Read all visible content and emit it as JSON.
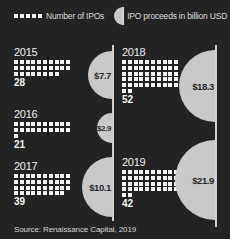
{
  "legend": {
    "ipo_count_label": "Number of IPOs",
    "proceeds_label": "IPO proceeds in billion USD"
  },
  "panels": [
    {
      "year": "2015",
      "count": "28",
      "proceeds": "$7.7"
    },
    {
      "year": "2016",
      "count": "21",
      "proceeds": "$2.9"
    },
    {
      "year": "2017",
      "count": "39",
      "proceeds": "$10.1"
    },
    {
      "year": "2018",
      "count": "52",
      "proceeds": "$18.3"
    },
    {
      "year": "2019",
      "count": "42",
      "proceeds": "$21.9"
    }
  ],
  "source": "Source: Renaissance Capital, 2019",
  "colors": {
    "background": "#232323",
    "square": "#f4f4f4",
    "semicircle": "#c9c9c9",
    "divider": "#d0d0d0"
  },
  "chart_data": {
    "type": "bar",
    "title": "",
    "categories": [
      "2015",
      "2016",
      "2017",
      "2018",
      "2019"
    ],
    "series": [
      {
        "name": "Number of IPOs",
        "values": [
          28,
          21,
          39,
          52,
          42
        ]
      },
      {
        "name": "IPO proceeds in billion USD",
        "values": [
          7.7,
          2.9,
          10.1,
          18.3,
          21.9
        ]
      }
    ],
    "xlabel": "",
    "ylabel": "",
    "legend_position": "top",
    "annotations": [
      "Source: Renaissance Capital, 2019"
    ]
  }
}
